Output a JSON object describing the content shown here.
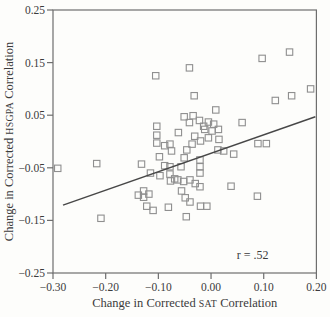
{
  "figure": {
    "kind": "scatter-plot-scan",
    "annotation_text": "r = .52"
  },
  "colors": {
    "background": "#fdfdfb",
    "frame": "#6e6e6e",
    "marker": "#8f8f8f",
    "trend_line": "#474747",
    "text": "#3b3b3b"
  },
  "chart_data": {
    "type": "scatter",
    "title": "",
    "xlabel": "Change in Corrected SAT Correlation",
    "ylabel": "Change in Corrected HSGPA Correlation",
    "xlabel_parts": {
      "prefix": "Change in Corrected ",
      "acronym": "SAT",
      "suffix": " Correlation"
    },
    "ylabel_parts": {
      "prefix": "Change in Corrected ",
      "acronym": "HSGPA",
      "suffix": " Correlation"
    },
    "xlim": [
      -0.3,
      0.2
    ],
    "ylim": [
      -0.25,
      0.25
    ],
    "xticks": {
      "values": [
        -0.3,
        -0.2,
        -0.1,
        0.0,
        0.1,
        0.2
      ],
      "labels": [
        "−0.30",
        "−0.20",
        "−0.10",
        "0.00",
        "0.10",
        "0.20"
      ]
    },
    "yticks": {
      "values": [
        0.25,
        0.15,
        0.05,
        -0.05,
        -0.15,
        -0.25
      ],
      "labels": [
        "0.25",
        "0.15",
        "0.05",
        "−0.05",
        "−0.15",
        "−0.25"
      ]
    },
    "grid": false,
    "frame": "box",
    "legend": "none",
    "marker": "open-square",
    "points": [
      [
        -0.105,
        0.125
      ],
      [
        -0.041,
        0.14
      ],
      [
        0.097,
        0.158
      ],
      [
        0.149,
        0.17
      ],
      [
        0.189,
        0.1
      ],
      [
        0.153,
        0.087
      ],
      [
        0.122,
        0.078
      ],
      [
        -0.032,
        0.087
      ],
      [
        0.009,
        0.06
      ],
      [
        0.059,
        0.036
      ],
      [
        -0.103,
        0.029
      ],
      [
        -0.103,
        0.012
      ],
      [
        -0.103,
        -0.003
      ],
      [
        -0.098,
        -0.029
      ],
      [
        -0.051,
        0.047
      ],
      [
        -0.041,
        0.036
      ],
      [
        -0.034,
        0.049
      ],
      [
        -0.022,
        0.04
      ],
      [
        -0.014,
        0.029
      ],
      [
        -0.062,
        0.017
      ],
      [
        -0.031,
        0.01
      ],
      [
        -0.02,
        0.001
      ],
      [
        -0.005,
        0.037
      ],
      [
        0.005,
        0.033
      ],
      [
        -0.012,
        0.023
      ],
      [
        0.002,
        0.02
      ],
      [
        0.014,
        0.023
      ],
      [
        -0.005,
        0.007
      ],
      [
        0.015,
        0.004
      ],
      [
        -0.088,
        -0.008
      ],
      [
        -0.078,
        -0.005
      ],
      [
        -0.075,
        -0.018
      ],
      [
        -0.046,
        -0.016
      ],
      [
        -0.036,
        -0.005
      ],
      [
        0.013,
        -0.016
      ],
      [
        0.024,
        -0.018
      ],
      [
        0.043,
        -0.024
      ],
      [
        0.089,
        -0.004
      ],
      [
        0.105,
        -0.004
      ],
      [
        -0.021,
        -0.035
      ],
      [
        -0.021,
        -0.048
      ],
      [
        -0.021,
        -0.06
      ],
      [
        -0.021,
        -0.086
      ],
      [
        -0.051,
        -0.031
      ],
      [
        -0.088,
        -0.046
      ],
      [
        -0.078,
        -0.048
      ],
      [
        -0.057,
        -0.048
      ],
      [
        -0.115,
        -0.06
      ],
      [
        -0.097,
        -0.065
      ],
      [
        -0.078,
        -0.062
      ],
      [
        -0.069,
        -0.071
      ],
      [
        -0.077,
        -0.075
      ],
      [
        -0.063,
        -0.073
      ],
      [
        -0.052,
        -0.076
      ],
      [
        -0.04,
        -0.073
      ],
      [
        -0.03,
        -0.08
      ],
      [
        -0.138,
        -0.102
      ],
      [
        -0.128,
        -0.094
      ],
      [
        -0.128,
        -0.106
      ],
      [
        -0.118,
        -0.1
      ],
      [
        -0.122,
        -0.123
      ],
      [
        -0.11,
        -0.131
      ],
      [
        -0.081,
        -0.125
      ],
      [
        -0.056,
        -0.094
      ],
      [
        -0.049,
        -0.107
      ],
      [
        -0.04,
        -0.115
      ],
      [
        -0.02,
        -0.123
      ],
      [
        -0.008,
        -0.123
      ],
      [
        -0.047,
        -0.143
      ],
      [
        0.038,
        -0.085
      ],
      [
        0.088,
        -0.104
      ],
      [
        -0.291,
        -0.051
      ],
      [
        -0.217,
        -0.042
      ],
      [
        -0.132,
        -0.043
      ],
      [
        -0.209,
        -0.146
      ]
    ],
    "trend_line": {
      "x1": -0.281,
      "y1": -0.121,
      "x2": 0.198,
      "y2": 0.047
    },
    "annotation": {
      "text": "r = .52",
      "x": 0.079,
      "y": -0.216
    },
    "correlation_r": 0.52
  },
  "layout_px": {
    "plot_left": 53,
    "plot_right": 316.4,
    "plot_top": 10,
    "plot_bottom": 273,
    "tick_len": 6,
    "marker_size": 6.4
  }
}
